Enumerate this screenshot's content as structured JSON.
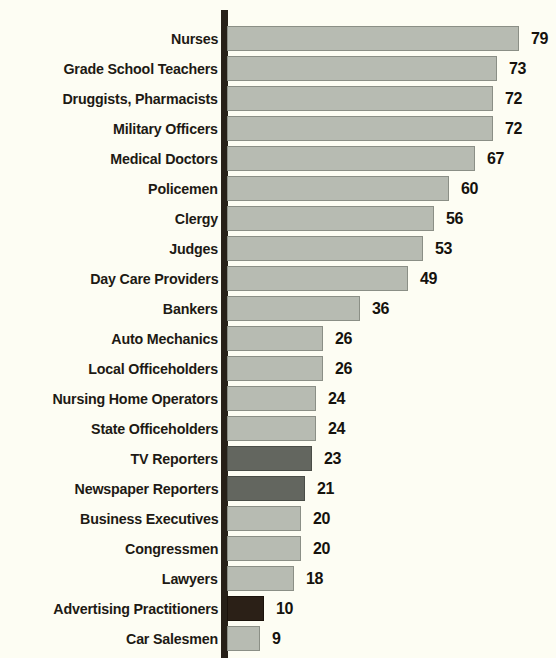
{
  "chart_data": {
    "type": "bar",
    "orientation": "horizontal",
    "title": "",
    "subtitle": "",
    "xlabel": "",
    "ylabel": "",
    "xlim": [
      0,
      80
    ],
    "grid": false,
    "legend": "none",
    "value_suffix": "",
    "categories": [
      "Nurses",
      "Grade School Teachers",
      "Druggists, Pharmacists",
      "Military Officers",
      "Medical Doctors",
      "Policemen",
      "Clergy",
      "Judges",
      "Day Care Providers",
      "Bankers",
      "Auto Mechanics",
      "Local Officeholders",
      "Nursing Home Operators",
      "State Officeholders",
      "TV Reporters",
      "Newspaper Reporters",
      "Business Executives",
      "Congressmen",
      "Lawyers",
      "Advertising Practitioners",
      "Car Salesmen"
    ],
    "values": [
      79,
      73,
      72,
      72,
      67,
      60,
      56,
      53,
      49,
      36,
      26,
      26,
      24,
      24,
      23,
      21,
      20,
      20,
      18,
      10,
      9
    ],
    "value_labels": [
      "79",
      "73",
      "72",
      "72",
      "67",
      "60",
      "56",
      "53",
      "49",
      "36",
      "26",
      "26",
      "24",
      "24",
      "23",
      "21",
      "20",
      "20",
      "18",
      "10",
      "9"
    ],
    "bar_shades": [
      "light",
      "light",
      "light",
      "light",
      "light",
      "light",
      "light",
      "light",
      "light",
      "light",
      "light",
      "light",
      "light",
      "light",
      "dark",
      "dark",
      "light",
      "light",
      "light",
      "darkest",
      "light"
    ],
    "colors": {
      "background": "#fdfdf3",
      "bar_light": "#b7bbb2",
      "bar_dark": "#63665f",
      "bar_darkest": "#2b2017",
      "axis": "#272018",
      "text": "#1d1a14"
    }
  }
}
